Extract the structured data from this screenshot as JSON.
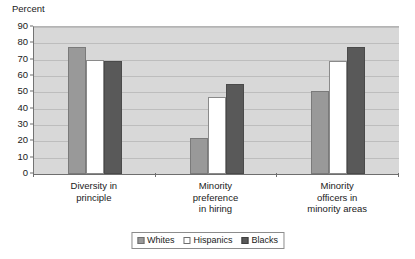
{
  "chart_data": {
    "type": "bar",
    "title": "",
    "xlabel": "",
    "ylabel": "Percent",
    "ylim": [
      0,
      90
    ],
    "ytick_step": 10,
    "yticks": [
      90,
      80,
      70,
      60,
      50,
      40,
      30,
      20,
      10,
      0
    ],
    "grid": true,
    "legend_position": "bottom-center",
    "categories": [
      "Diversity in\nprinciple",
      "Minority\npreference\nin hiring",
      "Minority\nofficers in\nminority areas"
    ],
    "series": [
      {
        "name": "Whites",
        "color": "#999999",
        "values": [
          78,
          22,
          51
        ]
      },
      {
        "name": "Hispanics",
        "color": "#ffffff",
        "values": [
          70,
          47,
          69
        ]
      },
      {
        "name": "Blacks",
        "color": "#595959",
        "values": [
          69,
          55,
          78
        ]
      }
    ]
  },
  "axis": {
    "y_caption": "Percent"
  },
  "legend": {
    "items": [
      {
        "label": "Whites"
      },
      {
        "label": "Hispanics"
      },
      {
        "label": "Blacks"
      }
    ]
  },
  "colors": {
    "plot_background": "#d8d8d8",
    "gridline": "#bdbdbd",
    "axis_line": "#6e6e6e",
    "page_background": "#ffffff",
    "text": "#1a1a1a"
  }
}
